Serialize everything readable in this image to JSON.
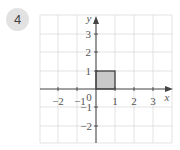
{
  "question": {
    "number": "4"
  },
  "graph": {
    "x_axis_label": "x",
    "y_axis_label": "y",
    "origin_label": "0",
    "x_ticks": [
      "−2",
      "−1",
      "1",
      "2",
      "3"
    ],
    "y_ticks": [
      "3",
      "2",
      "1",
      "−1",
      "−2"
    ],
    "x_range": [
      -3,
      4
    ],
    "y_range": [
      -3,
      4
    ],
    "grid": true,
    "shape": {
      "type": "unit-square",
      "vertices": [
        [
          0,
          0
        ],
        [
          1,
          0
        ],
        [
          1,
          1
        ],
        [
          0,
          1
        ]
      ],
      "fill_color": "#c9c9c9",
      "stroke_color": "#333333"
    },
    "colors": {
      "grid": "#dcdcdc",
      "axis": "#444444",
      "badge": "#e2e2e2"
    }
  }
}
